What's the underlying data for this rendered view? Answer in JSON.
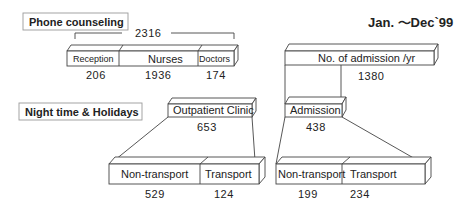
{
  "title": "Jan. ～Dec`99",
  "sections": {
    "phone": "Phone counseling",
    "night": "Night time & Holidays"
  },
  "phone_counseling": {
    "total": "2316",
    "segments": [
      {
        "label": "Reception",
        "value": "206"
      },
      {
        "label": "Nurses",
        "value": "1936"
      },
      {
        "label": "Doctors",
        "value": "174"
      }
    ]
  },
  "admission_per_year": {
    "label": "No. of admission /yr",
    "value": "1380"
  },
  "outpatient": {
    "label": "Outpatient Clinic",
    "value": "653",
    "segments": [
      {
        "label": "Non-transport",
        "value": "529"
      },
      {
        "label": "Transport",
        "value": "124"
      }
    ]
  },
  "admission": {
    "label": "Admission",
    "value": "438",
    "segments": [
      {
        "label": "Non-transport",
        "value": "199"
      },
      {
        "label": "Transport",
        "value": "234"
      }
    ]
  }
}
